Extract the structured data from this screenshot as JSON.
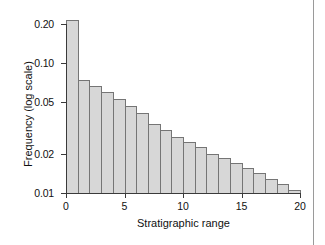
{
  "figure": {
    "y_axis_title": "Frequency (log scale)",
    "x_axis_title": "Stratigraphic range"
  },
  "chart_data": {
    "type": "bar",
    "title": "",
    "subtitle": "",
    "xlabel": "Stratigraphic range",
    "ylabel": "Frequency (log scale)",
    "yscale": "log",
    "ylim": [
      0.01,
      0.24
    ],
    "xlim": [
      0,
      20
    ],
    "grid": false,
    "legend": null,
    "y_ticks": [
      0.2,
      0.1,
      0.05,
      0.02,
      0.01
    ],
    "y_tick_labels": [
      "0.20",
      "0.10",
      "0.05",
      "0.02",
      "0.01"
    ],
    "x_ticks": [
      0,
      5,
      10,
      15,
      20
    ],
    "x_tick_labels": [
      "0",
      "5",
      "10",
      "15",
      "20"
    ],
    "bin_edges": [
      0,
      1,
      2,
      3,
      4,
      5,
      6,
      7,
      8,
      9,
      10,
      11,
      12,
      13,
      14,
      15,
      16,
      17,
      18,
      19,
      20
    ],
    "categories": [
      "0-1",
      "1-2",
      "2-3",
      "3-4",
      "4-5",
      "5-6",
      "6-7",
      "7-8",
      "8-9",
      "9-10",
      "10-11",
      "11-12",
      "12-13",
      "13-14",
      "14-15",
      "15-16",
      "16-17",
      "17-18",
      "18-19",
      "19-20"
    ],
    "values": [
      0.215,
      0.074,
      0.067,
      0.06,
      0.053,
      0.047,
      0.041,
      0.034,
      0.0305,
      0.027,
      0.0245,
      0.0225,
      0.02,
      0.0185,
      0.017,
      0.0155,
      0.0142,
      0.0128,
      0.0117,
      0.0106
    ],
    "bar_fill_color": "#d7d7d7",
    "bar_edge_color": "#757575",
    "axis_color": "#3a3a3a"
  }
}
